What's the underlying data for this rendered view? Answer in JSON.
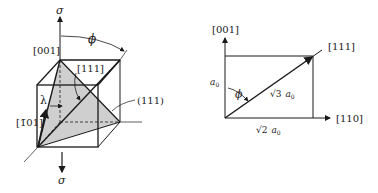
{
  "figure_left": {
    "title": "Slip system in unit cube under tensile stress",
    "labels": {
      "sigma_top": "σ",
      "sigma_bottom": "σ",
      "dir_001": "[001]",
      "phi": "ϕ",
      "dir_111": "[111]",
      "plane_111": "(111)",
      "lambda": "λ",
      "dir_m101": "[1̄01]"
    },
    "colors": {
      "line": "#1a1a1a",
      "plane_fill": "#cfcfcf"
    }
  },
  "figure_right": {
    "labels": {
      "axis_001": "[001]",
      "axis_110": "[110]",
      "dir_111": "[111]",
      "side_a0": "a",
      "side_a0_sub": "0",
      "phi": "ϕ",
      "diag_sqrt": "√3",
      "diag_a": "a",
      "diag_sub": "0",
      "base_sqrt": "√2",
      "base_a": "a",
      "base_sub": "0"
    }
  }
}
